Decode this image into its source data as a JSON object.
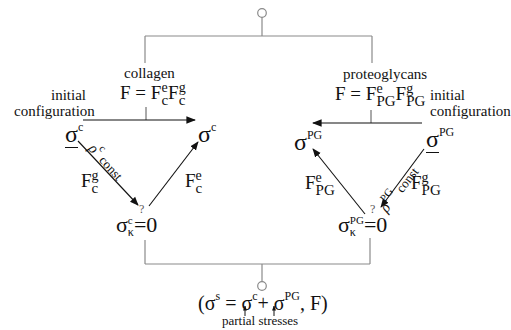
{
  "diagram": {
    "colors": {
      "line": "#8a8a8a",
      "arrow": "#111111",
      "text": "#111111"
    },
    "collagen": {
      "label": "collagen",
      "F_eq": "F = ",
      "F_base": "F",
      "Fe_sup": "e",
      "Fe_sub": "c",
      "Fg_sup": "g",
      "Fg_sub": "c",
      "initial_line1": "initial",
      "initial_line2": "configuration",
      "sigma_initial": "σ",
      "sigma_initial_sup": "c",
      "sigma_current": "σ",
      "sigma_current_sup": "c",
      "density_symbol": "ρ",
      "density_sup": "c",
      "density_text": "const",
      "left_edge_F": "F",
      "left_edge_sup": "g",
      "left_edge_sub": "c",
      "right_edge_F": "F",
      "right_edge_sup": "e",
      "right_edge_sub": "c",
      "intermediate_sigma": "σ",
      "intermediate_sup": "c",
      "intermediate_sub": "κ",
      "intermediate_eq": "=0",
      "question": "?"
    },
    "proteoglycans": {
      "label": "proteoglycans",
      "F_eq": "F = ",
      "F_base": "F",
      "Fe_sup": "e",
      "Fe_sub": "PG",
      "Fg_sup": "g",
      "Fg_sub": "PG",
      "initial_line1": "initial",
      "initial_line2": "configuration",
      "sigma_initial": "σ",
      "sigma_initial_sup": "PG",
      "sigma_current": "σ",
      "sigma_current_sup": "PG",
      "density_symbol": "ρ",
      "density_sup": "PG",
      "density_text": "const",
      "left_edge_F": "F",
      "left_edge_sup": "e",
      "left_edge_sub": "PG",
      "right_edge_F": "F",
      "right_edge_sup": "g",
      "right_edge_sub": "PG",
      "intermediate_sigma": "σ",
      "intermediate_sup": "PG",
      "intermediate_sub": "κ",
      "intermediate_eq": "=0",
      "question": "?"
    },
    "mixture": {
      "open_paren": "(σ",
      "s_sup": "s",
      "eq": " = ",
      "sigma_c": "σ",
      "c_sup": "c",
      "plus": "+ ",
      "sigma_pg": "σ",
      "pg_sup": "PG",
      "tail": ",  F)",
      "partial_label": "partial stresses"
    }
  }
}
